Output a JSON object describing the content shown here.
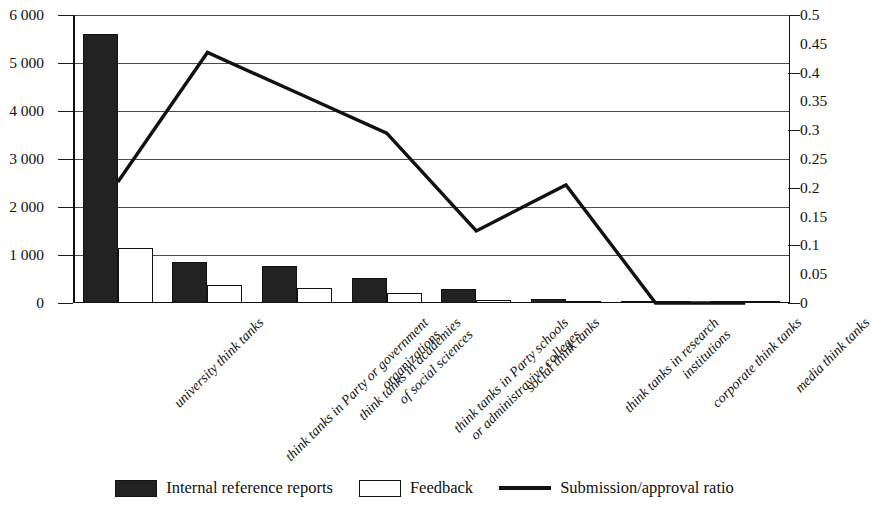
{
  "chart_data": {
    "type": "bar",
    "title": "",
    "subtitle": "",
    "xlabel": "",
    "ylabel": "",
    "y2label": "",
    "grid": true,
    "legend_position": "bottom",
    "categories": [
      [
        "university think tanks"
      ],
      [
        "think tanks in Party or government",
        "organizations"
      ],
      [
        "think tanks in academies",
        "of social sciences"
      ],
      [
        "think tanks in Party schools",
        "or administravive colleges"
      ],
      [
        "social think tanks"
      ],
      [
        "think tanks in research",
        "institutions"
      ],
      [
        "corporate think tanks"
      ],
      [
        "media think tanks"
      ]
    ],
    "category_labels_flat": [
      "university think tanks",
      "think tanks in Party or government organizations",
      "think tanks in academies of social sciences",
      "think tanks in Party schools or administravive colleges",
      "social think tanks",
      "think tanks in research institutions",
      "corporate think tanks",
      "media think tanks"
    ],
    "ylim": [
      0,
      6000
    ],
    "yticks": [
      0,
      1000,
      2000,
      3000,
      4000,
      5000,
      6000
    ],
    "ytick_labels": [
      "0",
      "1 000",
      "2 000",
      "3 000",
      "4 000",
      "5 000",
      "6 000"
    ],
    "y2lim": [
      0,
      0.5
    ],
    "y2ticks": [
      0,
      0.05,
      0.1,
      0.15,
      0.2,
      0.25,
      0.3,
      0.35,
      0.4,
      0.45,
      0.5
    ],
    "y2tick_labels": [
      "0",
      "0.05",
      "0.1",
      "0.15",
      "0.2",
      "0.25",
      "0.3",
      "0.35",
      "0.4",
      "0.45",
      "0.5"
    ],
    "y2_gridline_values": [
      0,
      0.1,
      0.2,
      0.3,
      0.4,
      0.5
    ],
    "series": [
      {
        "name": "Internal reference reports",
        "type": "bar",
        "axis": "left",
        "color": "#222222",
        "fill": "solid",
        "values": [
          5600,
          860,
          780,
          530,
          300,
          90,
          8,
          4
        ]
      },
      {
        "name": "Feedback",
        "type": "bar",
        "axis": "left",
        "color": "#ffffff",
        "fill": "hollow",
        "values": [
          1150,
          370,
          310,
          215,
          65,
          25,
          3,
          2
        ]
      },
      {
        "name": "Submission/approval ratio",
        "type": "line",
        "axis": "right",
        "color": "#111111",
        "values": [
          0.21,
          0.435,
          0.365,
          0.295,
          0.125,
          0.205,
          0.0,
          0.0
        ]
      }
    ]
  },
  "legend": {
    "items": [
      {
        "label": "Internal reference reports",
        "marker": "filled-square"
      },
      {
        "label": "Feedback",
        "marker": "hollow-square"
      },
      {
        "label": "Submission/approval ratio",
        "marker": "line"
      }
    ]
  }
}
